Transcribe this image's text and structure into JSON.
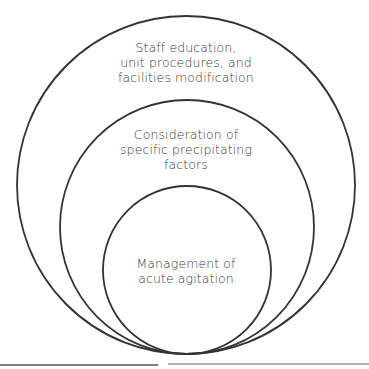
{
  "diagram": {
    "type": "nested-circles",
    "circles": [
      {
        "name": "outer",
        "cx": 186,
        "cy": 185,
        "r": 169,
        "lines": [
          "Staff education,",
          "unit procedures, and",
          "facilities modification"
        ]
      },
      {
        "name": "middle",
        "cx": 187,
        "cy": 227,
        "r": 127,
        "lines": [
          "Consideration of",
          "specific precipitating",
          "factors"
        ]
      },
      {
        "name": "inner",
        "cx": 187,
        "cy": 270,
        "r": 84,
        "lines": [
          "Management of",
          "acute agitation"
        ]
      }
    ],
    "stroke_color": "#333333",
    "text_color": "#3a3a3a"
  }
}
